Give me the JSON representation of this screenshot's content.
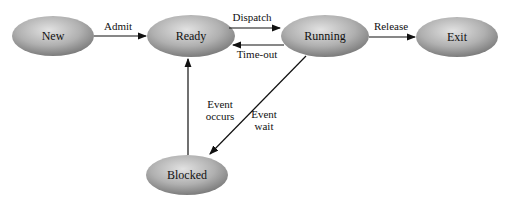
{
  "diagram": {
    "states": [
      {
        "id": "new",
        "label": "New"
      },
      {
        "id": "ready",
        "label": "Ready"
      },
      {
        "id": "running",
        "label": "Running"
      },
      {
        "id": "exit",
        "label": "Exit"
      },
      {
        "id": "blocked",
        "label": "Blocked"
      }
    ],
    "transitions": [
      {
        "from": "new",
        "to": "ready",
        "label": "Admit"
      },
      {
        "from": "ready",
        "to": "running",
        "label": "Dispatch"
      },
      {
        "from": "running",
        "to": "ready",
        "label": "Time-out"
      },
      {
        "from": "running",
        "to": "exit",
        "label": "Release"
      },
      {
        "from": "running",
        "to": "blocked",
        "label_line1": "Event",
        "label_line2": "wait"
      },
      {
        "from": "blocked",
        "to": "ready",
        "label_line1": "Event",
        "label_line2": "occurs"
      }
    ],
    "colors": {
      "node_light": "#d8d8d8",
      "node_dark": "#8a8a8a",
      "arrow": "#111111"
    }
  }
}
